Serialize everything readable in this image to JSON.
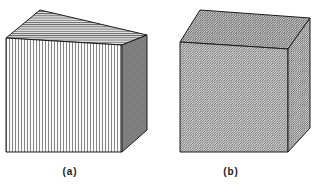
{
  "figure": {
    "background_color": "#ffffff",
    "line_color": "#1c1c1c",
    "hatch_color": "#4a4a4a",
    "fill_tint_top": "#d9d9d9",
    "fill_tint_front": "#ededed",
    "fill_tint_side": "#cfcfcf"
  },
  "cubes": [
    {
      "id": "cube-a",
      "caption": "(a)",
      "faces": {
        "top": {
          "name": "top-face",
          "hatch": "horizontal",
          "hatch_angle_deg": 0,
          "hatch_spacing_px": 2.2,
          "points": "40,10 147,35 122,45 6,38"
        },
        "front": {
          "name": "front-face",
          "hatch": "vertical",
          "hatch_angle_deg": 90,
          "hatch_spacing_px": 3.0,
          "points": "6,38 122,45 122,152 6,152"
        },
        "side": {
          "name": "right-face",
          "hatch": "cross-hatch",
          "hatch_angle_deg": 45,
          "hatch_spacing_px": 1.6,
          "points": "122,45 147,35 147,130 122,152"
        }
      }
    },
    {
      "id": "cube-b",
      "caption": "(b)",
      "faces": {
        "top": {
          "name": "top-face",
          "hatch": "diagonal",
          "hatch_angle_deg": 45,
          "hatch_spacing_px": 2.4,
          "points": "200,10 310,18 288,49 180,42"
        },
        "front": {
          "name": "front-face",
          "hatch": "diagonal",
          "hatch_angle_deg": 45,
          "hatch_spacing_px": 2.4,
          "points": "180,42 288,49 288,152 180,152"
        },
        "side": {
          "name": "right-face",
          "hatch": "diagonal",
          "hatch_angle_deg": 45,
          "hatch_spacing_px": 2.4,
          "points": "288,49 310,18 310,128 288,152"
        }
      }
    }
  ]
}
